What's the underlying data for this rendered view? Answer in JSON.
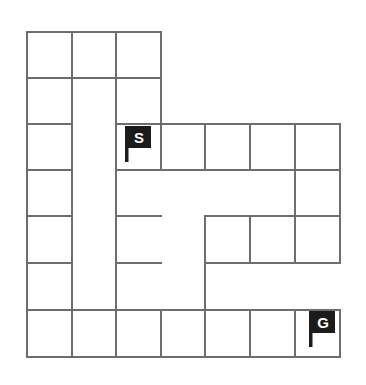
{
  "figure": {
    "kind": "maze-puzzle",
    "background_color": "#ffffff",
    "wall_color": "#6e6e6e",
    "marker_color": "#1b1b1b",
    "marker_text_color": "#ffffff"
  },
  "grid": {
    "columns": 7,
    "rows": 7,
    "origin_x": 27,
    "origin_y": 32,
    "cell_width": 44.7,
    "cell_height": 46.4
  },
  "markers": [
    {
      "name": "start",
      "label": "S",
      "col": 2,
      "row": 2,
      "plate_x": 127,
      "plate_y": 126,
      "plate_w": 24,
      "plate_h": 22,
      "pole_x": 125,
      "pole_y": 126,
      "pole_w": 3.5,
      "pole_h": 36
    },
    {
      "name": "goal",
      "label": "G",
      "col": 6,
      "row": 6,
      "plate_x": 311,
      "plate_y": 311,
      "plate_w": 24,
      "plate_h": 22,
      "pole_x": 309,
      "pole_y": 311,
      "pole_w": 3.5,
      "pole_h": 36
    }
  ],
  "walls": {
    "horizontal_segments": [
      {
        "x1": 27,
        "y1": 32,
        "x2": 161,
        "y2": 32
      },
      {
        "x1": 27,
        "y1": 78,
        "x2": 161,
        "y2": 78
      },
      {
        "x1": 27,
        "y1": 124,
        "x2": 72,
        "y2": 124
      },
      {
        "x1": 116,
        "y1": 124,
        "x2": 340,
        "y2": 124
      },
      {
        "x1": 27,
        "y1": 170,
        "x2": 72,
        "y2": 170
      },
      {
        "x1": 116,
        "y1": 170,
        "x2": 340,
        "y2": 170
      },
      {
        "x1": 27,
        "y1": 216,
        "x2": 72,
        "y2": 216
      },
      {
        "x1": 116,
        "y1": 216,
        "x2": 161,
        "y2": 216
      },
      {
        "x1": 205,
        "y1": 216,
        "x2": 340,
        "y2": 216
      },
      {
        "x1": 27,
        "y1": 263,
        "x2": 72,
        "y2": 263
      },
      {
        "x1": 116,
        "y1": 263,
        "x2": 161,
        "y2": 263
      },
      {
        "x1": 205,
        "y1": 263,
        "x2": 340,
        "y2": 263
      },
      {
        "x1": 27,
        "y1": 310,
        "x2": 340,
        "y2": 310
      },
      {
        "x1": 27,
        "y1": 357,
        "x2": 340,
        "y2": 357
      }
    ],
    "vertical_segments": [
      {
        "x1": 27,
        "y1": 32,
        "x2": 27,
        "y2": 357
      },
      {
        "x1": 72,
        "y1": 32,
        "x2": 72,
        "y2": 357
      },
      {
        "x1": 116,
        "y1": 32,
        "x2": 116,
        "y2": 357
      },
      {
        "x1": 161,
        "y1": 32,
        "x2": 161,
        "y2": 124
      },
      {
        "x1": 161,
        "y1": 124,
        "x2": 161,
        "y2": 170
      },
      {
        "x1": 161,
        "y1": 310,
        "x2": 161,
        "y2": 357
      },
      {
        "x1": 205,
        "y1": 124,
        "x2": 205,
        "y2": 170
      },
      {
        "x1": 205,
        "y1": 216,
        "x2": 205,
        "y2": 357
      },
      {
        "x1": 250,
        "y1": 124,
        "x2": 250,
        "y2": 170
      },
      {
        "x1": 250,
        "y1": 216,
        "x2": 250,
        "y2": 263
      },
      {
        "x1": 250,
        "y1": 310,
        "x2": 250,
        "y2": 357
      },
      {
        "x1": 295,
        "y1": 124,
        "x2": 295,
        "y2": 263
      },
      {
        "x1": 295,
        "y1": 310,
        "x2": 295,
        "y2": 357
      },
      {
        "x1": 340,
        "y1": 124,
        "x2": 340,
        "y2": 263
      },
      {
        "x1": 340,
        "y1": 310,
        "x2": 340,
        "y2": 357
      }
    ]
  }
}
